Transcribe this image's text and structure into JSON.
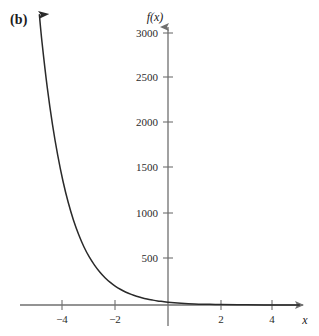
{
  "figure": {
    "panel_label": "(b)",
    "background_color": "#ffffff",
    "axis_color": "#6f6f6f",
    "curve_color": "#2a2a2a",
    "text_color": "#1a1a1a"
  },
  "chart_data": {
    "type": "line",
    "title": "",
    "subtitle": "",
    "xlabel": "x",
    "ylabel": "f(x)",
    "xlim": [
      -5.6,
      5.25
    ],
    "ylim": [
      -230,
      3140
    ],
    "grid": false,
    "legend": null,
    "annotations": [
      "(b)"
    ],
    "xticks": [
      -4,
      -2,
      2,
      4
    ],
    "xticklabels": [
      "−4",
      "−2",
      "2",
      "4"
    ],
    "yticks": [
      500,
      1000,
      1500,
      2000,
      2500,
      3000
    ],
    "yticklabels": [
      "500",
      "1000",
      "1500",
      "2000",
      "2500",
      "3000"
    ],
    "series": [
      {
        "name": "f(x)",
        "style": "solid",
        "arrow_head_at_start": true,
        "x": [
          -4.9,
          -4.8,
          -4.6,
          -4.4,
          -4.2,
          -4.0,
          -3.8,
          -3.6,
          -3.4,
          -3.2,
          -3.0,
          -2.8,
          -2.6,
          -2.4,
          -2.2,
          -2.0,
          -1.8,
          -1.6,
          -1.4,
          -1.2,
          -1.0,
          -0.8,
          -0.6,
          -0.4,
          -0.2,
          0.0,
          0.5,
          1.0,
          1.5,
          2.0,
          3.0,
          4.0,
          5.0
        ],
        "y": [
          3200,
          2900,
          2400,
          1990,
          1650,
          1365,
          1130,
          935,
          775,
          640,
          530,
          440,
          364,
          301,
          249,
          206,
          171,
          141,
          117,
          97,
          80,
          66,
          55,
          45,
          38,
          31,
          20,
          12,
          8,
          5,
          2,
          1,
          0
        ]
      }
    ]
  }
}
